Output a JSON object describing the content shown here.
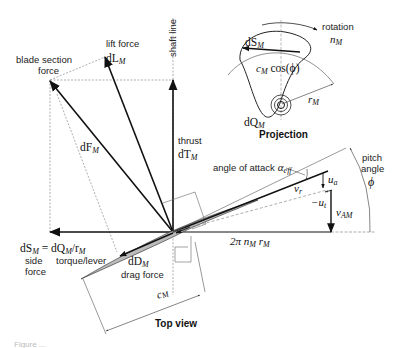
{
  "diagram": {
    "views": {
      "top_view_label": "Top view",
      "projection_label": "Projection"
    },
    "labels": {
      "shaft_line": "shaft line",
      "lift_force": "lift force",
      "lift_symbol": "dL",
      "lift_sub": "M",
      "blade_section_force_1": "blade section",
      "blade_section_force_2": "force",
      "dF_symbol": "dF",
      "dF_sub": "M",
      "thrust": "thrust",
      "thrust_symbol": "dT",
      "thrust_sub": "M",
      "side_eq_left": "dS",
      "side_eq_left_sub": "M",
      "side_eq_mid": " = dQ",
      "side_eq_mid_sub": "M",
      "side_eq_right": "/r",
      "side_eq_right_sub": "M",
      "side": "side",
      "force": "force",
      "torque_lever": "torque/lever",
      "drag_symbol": "dD",
      "drag_sub": "M",
      "drag_force": "drag force",
      "chord": "c",
      "chord_sub": "M",
      "angle_of_attack": "angle of attack",
      "alpha": "α",
      "alpha_sub": "eff",
      "pitch_1": "pitch",
      "pitch_2": "angle",
      "phi": "ϕ",
      "vr": "v",
      "vr_sub": "r",
      "ua": "u",
      "ua_sub": "a",
      "ut": "−u",
      "ut_sub": "t",
      "vAM": "v",
      "vAM_sub": "AM",
      "circ_speed": "2π n",
      "circ_speed_sub": "M",
      "circ_r": " r",
      "circ_r_sub": "M",
      "rotation": "rotation",
      "n": "n",
      "n_sub": "M",
      "proj_dS": "dS",
      "proj_dS_sub": "M",
      "proj_c": "c",
      "proj_c_sub": "M",
      "proj_cos": " cos(ϕ)",
      "proj_r": "r",
      "proj_r_sub": "M",
      "proj_dQ": "dQ",
      "proj_dQ_sub": "M"
    },
    "caption_fragment": "Figure ..."
  }
}
